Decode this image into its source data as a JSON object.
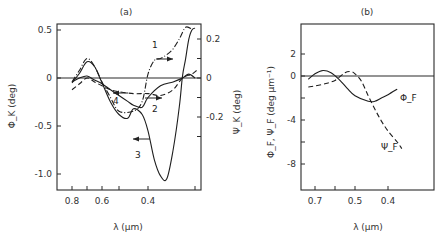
{
  "chart_data": [
    {
      "panel": "(a)",
      "type": "line",
      "title": "(a)",
      "xlabel": "λ (μm)",
      "ylabel": "Φ_K (deg)",
      "ylabel_right": "Ψ_K (deg)",
      "x_ticks": [
        0.8,
        0.7,
        0.6,
        0.5,
        0.4,
        0.25
      ],
      "x_tick_labels": [
        "0.8",
        "0.6",
        "0.4"
      ],
      "y_ticks_left": [
        0.5,
        0,
        -0.5,
        -1.0
      ],
      "y_ticks_left_labels": [
        "0.5",
        "0",
        "-0.5",
        "-1.0"
      ],
      "y_ticks_right": [
        0.2,
        0.1,
        0,
        -0.1,
        -0.2,
        -0.3
      ],
      "y_ticks_right_labels": [
        "0.2",
        "0",
        "-0.2"
      ],
      "ylim_left": [
        -1.2,
        0.5
      ],
      "ylim_right": [
        -0.6,
        0.25
      ],
      "grid": false,
      "series": [
        {
          "name": "1",
          "axis": "right",
          "style": "dash-dot",
          "x": [
            0.8,
            0.75,
            0.7,
            0.65,
            0.6,
            0.55,
            0.5,
            0.45,
            0.42,
            0.4,
            0.38,
            0.36,
            0.34,
            0.32,
            0.3,
            0.28,
            0.26
          ],
          "y": [
            -0.02,
            0.04,
            0.1,
            0.06,
            -0.02,
            -0.1,
            -0.17,
            -0.17,
            -0.12,
            0.02,
            0.09,
            0.1,
            0.12,
            0.15,
            0.2,
            0.26,
            0.25
          ]
        },
        {
          "name": "2",
          "axis": "right",
          "style": "dashed",
          "x": [
            0.8,
            0.75,
            0.7,
            0.65,
            0.6,
            0.55,
            0.5,
            0.45,
            0.4,
            0.36,
            0.32,
            0.29,
            0.26,
            0.24
          ],
          "y": [
            -0.06,
            -0.03,
            0.0,
            -0.02,
            -0.04,
            -0.06,
            -0.07,
            -0.08,
            -0.08,
            -0.09,
            -0.06,
            0.0,
            0.02,
            0.04
          ]
        },
        {
          "name": "3",
          "axis": "left",
          "style": "solid",
          "x": [
            0.8,
            0.75,
            0.7,
            0.65,
            0.6,
            0.55,
            0.5,
            0.47,
            0.45,
            0.42,
            0.4,
            0.38,
            0.36,
            0.34,
            0.32,
            0.3,
            0.29,
            0.28,
            0.27,
            0.26,
            0.25
          ],
          "y": [
            -0.05,
            0.05,
            0.17,
            0.12,
            -0.05,
            -0.25,
            -0.38,
            -0.42,
            -0.32,
            -0.38,
            -0.55,
            -0.85,
            -1.02,
            -1.05,
            -0.75,
            -0.3,
            0.02,
            0.2,
            0.4,
            0.5,
            0.52
          ]
        },
        {
          "name": "4",
          "axis": "right",
          "style": "solid",
          "x": [
            0.8,
            0.75,
            0.7,
            0.65,
            0.6,
            0.55,
            0.5,
            0.47,
            0.45,
            0.42,
            0.4,
            0.36,
            0.32,
            0.29,
            0.27,
            0.25
          ],
          "y": [
            -0.02,
            0.0,
            0.01,
            -0.01,
            -0.03,
            -0.06,
            -0.09,
            -0.12,
            -0.14,
            -0.15,
            -0.1,
            -0.04,
            -0.02,
            0.0,
            0.02,
            0.0
          ]
        }
      ],
      "annotations": [
        "1 →",
        "2 →",
        "← 3",
        "← 4"
      ]
    },
    {
      "panel": "(b)",
      "type": "line",
      "title": "(b)",
      "xlabel": "λ (μm)",
      "ylabel": "Φ_F, Ψ_F (deg μm⁻¹)",
      "x_ticks": [
        0.7,
        0.6,
        0.5,
        0.4
      ],
      "x_tick_labels": [
        "0.7",
        "0.5",
        "0.4"
      ],
      "y_ticks": [
        2,
        0,
        -2,
        -4,
        -6,
        -8
      ],
      "y_tick_labels": [
        "2",
        "0",
        "-4",
        "-8"
      ],
      "ylim": [
        -10.5,
        4.5
      ],
      "grid": false,
      "series": [
        {
          "name": "Φ_F",
          "style": "solid",
          "x": [
            0.74,
            0.7,
            0.66,
            0.62,
            0.58,
            0.54,
            0.5,
            0.46,
            0.44,
            0.42,
            0.4,
            0.38
          ],
          "y": [
            -0.3,
            0.2,
            0.5,
            0.3,
            -0.3,
            -1.1,
            -1.8,
            -2.3,
            -2.3,
            -2.0,
            -1.7,
            -1.2
          ]
        },
        {
          "name": "Ψ_F",
          "style": "dashed",
          "x": [
            0.74,
            0.7,
            0.65,
            0.6,
            0.55,
            0.52,
            0.5,
            0.48,
            0.46,
            0.44,
            0.42,
            0.4,
            0.38,
            0.37
          ],
          "y": [
            -1.0,
            -0.9,
            -0.7,
            -0.4,
            0.3,
            0.4,
            0.2,
            -0.5,
            -1.8,
            -3.0,
            -4.1,
            -5.0,
            -6.0,
            -6.6
          ]
        }
      ],
      "annotations": [
        "Φ_F",
        "Ψ_F"
      ]
    }
  ],
  "panel_a": {
    "title": "(a)",
    "xlabel": "λ (μm)",
    "ylabel_left": "Φ_K (deg)",
    "ylabel_right": "Ψ_K (deg)",
    "curve_labels": [
      "1",
      "2",
      "3",
      "4"
    ]
  },
  "panel_b": {
    "title": "(b)",
    "xlabel": "λ (μm)",
    "ylabel": "Φ_F, Ψ_F (deg μm⁻¹)",
    "curve_labels": [
      "Φ_F",
      "Ψ_F"
    ]
  }
}
